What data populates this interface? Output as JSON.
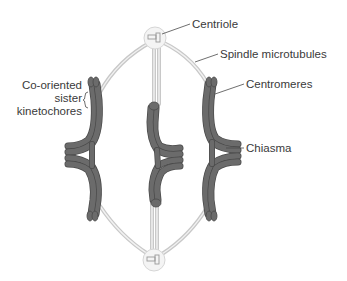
{
  "diagram": {
    "labels": {
      "centriole": "Centriole",
      "spindle": "Spindle microtubules",
      "centromeres": "Centromeres",
      "chiasma": "Chiasma",
      "kinetochores_line1": "Co-oriented",
      "kinetochores_line2": "sister",
      "kinetochores_line3": "kinetochores"
    },
    "colors": {
      "chromosome": "#6b6b6b",
      "chromosome_edge": "#4a4a4a",
      "microtubule": "#c8c8c8",
      "centriole_halo": "#f4f4f4",
      "label_text": "#3a3a3a"
    },
    "structures": {
      "centrioles": [
        "top-pole",
        "bottom-pole"
      ],
      "bivalents": [
        "left-bivalent",
        "center-bivalent",
        "right-bivalent"
      ]
    }
  }
}
